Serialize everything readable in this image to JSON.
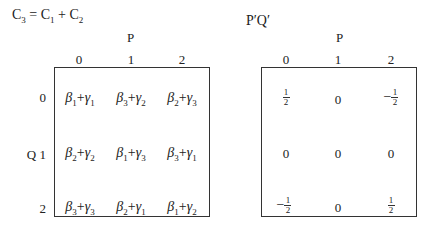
{
  "left": {
    "title": {
      "base": "C",
      "sub": "3",
      "eq": " = ",
      "t1": "C",
      "t1sub": "1",
      "plus": " + ",
      "t2": "C",
      "t2sub": "2"
    },
    "col_axis": "P",
    "row_axis": "Q",
    "col_ticks": [
      "0",
      "1",
      "2"
    ],
    "row_ticks": [
      "0",
      "1",
      "2"
    ],
    "cells": [
      [
        {
          "b": "1",
          "g": "1"
        },
        {
          "b": "3",
          "g": "2"
        },
        {
          "b": "2",
          "g": "3"
        }
      ],
      [
        {
          "b": "2",
          "g": "2"
        },
        {
          "b": "1",
          "g": "3"
        },
        {
          "b": "3",
          "g": "1"
        }
      ],
      [
        {
          "b": "3",
          "g": "3"
        },
        {
          "b": "2",
          "g": "1"
        },
        {
          "b": "1",
          "g": "2"
        }
      ]
    ]
  },
  "right": {
    "title": "P′Q′",
    "col_axis": "P",
    "col_ticks": [
      "0",
      "1",
      "2"
    ],
    "cells": [
      [
        "1/2",
        "0",
        "-1/2"
      ],
      [
        "0",
        "0",
        "0"
      ],
      [
        "-1/2",
        "0",
        "1/2"
      ]
    ]
  }
}
